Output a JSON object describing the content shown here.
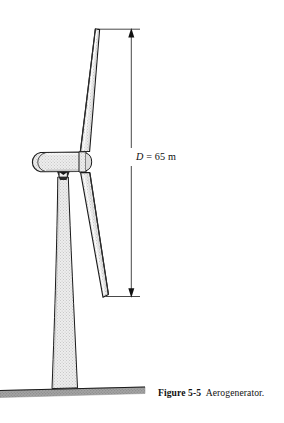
{
  "figure": {
    "caption_label": "Figure 5-5",
    "caption_text": "Aerogenerator.",
    "dimension": {
      "symbol": "D",
      "equals": "=",
      "value": "65",
      "unit": "m",
      "full_text": "D = 65 m"
    },
    "parts": {
      "upper_blade": "upper rotor blade",
      "lower_blade": "lower rotor blade",
      "nacelle": "nacelle housing",
      "hub": "rotor hub",
      "tower": "support tower",
      "ground": "ground line"
    },
    "colors": {
      "outline": "#1a1a1a",
      "fill_light": "#e6e6e6",
      "fill_mid": "#d2d2d2",
      "ground": "#9a9a9a",
      "paper": "#ffffff",
      "text": "#111111"
    }
  }
}
